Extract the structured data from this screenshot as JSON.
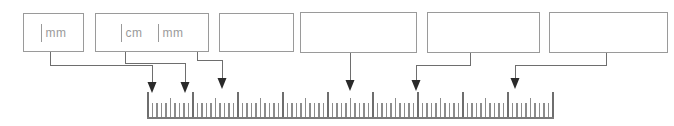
{
  "diagram": {
    "canvas": {
      "width": 674,
      "height": 126
    },
    "colors": {
      "box_border": "#9a9a9a",
      "text": "#9a9a9a",
      "connector": "#6e6e6e",
      "arrow": "#2a2a2a",
      "tick": "#8c8c8c",
      "tick_major": "#6e6e6e",
      "baseline": "#7a7a7a",
      "background": "#ffffff"
    }
  },
  "callouts": [
    {
      "id": "callout-1",
      "label": "| mm",
      "parts": [
        {
          "kind": "tick",
          "name": "tick-glyph"
        },
        {
          "kind": "text",
          "name": "unit-label",
          "text": "mm"
        }
      ],
      "box": {
        "x": 23,
        "y": 13,
        "w": 61,
        "h": 39
      },
      "empty": false
    },
    {
      "id": "callout-2",
      "label": "| cm | mm",
      "parts": [
        {
          "kind": "tick",
          "name": "tick-glyph"
        },
        {
          "kind": "text",
          "name": "unit-label",
          "text": "cm"
        },
        {
          "kind": "gap",
          "name": "spacer"
        },
        {
          "kind": "tick",
          "name": "tick-glyph"
        },
        {
          "kind": "text",
          "name": "unit-label",
          "text": "mm"
        }
      ],
      "box": {
        "x": 95,
        "y": 13,
        "w": 114,
        "h": 39
      },
      "empty": false
    },
    {
      "id": "callout-3",
      "label": "",
      "parts": [],
      "box": {
        "x": 219,
        "y": 13,
        "w": 75,
        "h": 39
      },
      "empty": true
    },
    {
      "id": "callout-4",
      "label": "",
      "parts": [],
      "box": {
        "x": 300,
        "y": 12,
        "w": 117,
        "h": 41
      },
      "empty": true
    },
    {
      "id": "callout-5",
      "label": "",
      "parts": [],
      "box": {
        "x": 427,
        "y": 12,
        "w": 113,
        "h": 41
      },
      "empty": true
    },
    {
      "id": "callout-6",
      "label": "",
      "parts": [],
      "box": {
        "x": 549,
        "y": 12,
        "w": 119,
        "h": 41
      },
      "empty": true
    }
  ],
  "connectors": [
    {
      "id": "connector-1",
      "from_callout": "callout-1",
      "start_x": 50,
      "start_y": 52,
      "elbow_y": 65,
      "end_x": 152,
      "arrow_y": 86
    },
    {
      "id": "connector-2",
      "from_callout": "callout-2",
      "start_x": 125,
      "start_y": 52,
      "elbow_y": 63,
      "end_x": 185,
      "arrow_y": 86
    },
    {
      "id": "connector-3",
      "from_callout": "callout-2",
      "start_x": 197,
      "start_y": 52,
      "elbow_y": 60,
      "end_x": 222,
      "arrow_y": 80
    },
    {
      "id": "connector-4",
      "from_callout": "callout-4",
      "start_x": 350,
      "start_y": 53,
      "elbow_y": 53,
      "end_x": 350,
      "arrow_y": 82
    },
    {
      "id": "connector-5",
      "from_callout": "callout-5",
      "start_x": 470,
      "start_y": 53,
      "elbow_y": 65,
      "end_x": 416,
      "arrow_y": 82
    },
    {
      "id": "connector-6",
      "from_callout": "callout-6",
      "start_x": 606,
      "start_y": 53,
      "elbow_y": 65,
      "end_x": 515,
      "arrow_y": 80
    }
  ],
  "arrows": [
    {
      "id": "arrow-1",
      "x": 152,
      "tip_y": 93,
      "width": 9,
      "height": 11
    },
    {
      "id": "arrow-2",
      "x": 185,
      "tip_y": 93,
      "width": 9,
      "height": 11
    },
    {
      "id": "arrow-3",
      "x": 222,
      "tip_y": 89,
      "width": 9,
      "height": 11
    },
    {
      "id": "arrow-4",
      "x": 350,
      "tip_y": 91,
      "width": 9,
      "height": 11
    },
    {
      "id": "arrow-5",
      "x": 416,
      "tip_y": 91,
      "width": 9,
      "height": 11
    },
    {
      "id": "arrow-6",
      "x": 515,
      "tip_y": 89,
      "width": 9,
      "height": 11
    }
  ],
  "ruler": {
    "id": "ruler",
    "x_start": 148,
    "x_end": 553,
    "y_top": 92,
    "y_baseline": 117,
    "baseline_height": 2,
    "tick_spacing": 4.5,
    "tick_count": 91,
    "tick_heights": {
      "minor": 14,
      "half": 19,
      "major": 25
    },
    "major_every": 10,
    "half_every": 5,
    "units": [
      "mm",
      "cm"
    ],
    "description": "Ruler strip showing millimetre minor ticks, 5 mm half ticks and centimetre major ticks"
  }
}
